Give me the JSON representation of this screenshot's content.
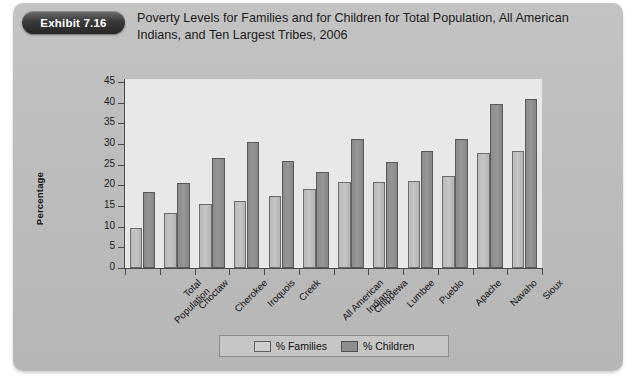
{
  "exhibit": {
    "badge_label": "Exhibit 7.16"
  },
  "header": {
    "title": "Poverty Levels for Families and for Children for Total Population, All American Indians, and Ten Largest Tribes, 2006"
  },
  "legend": {
    "families_label": "% Families",
    "children_label": "% Children"
  },
  "chart_data": {
    "type": "bar",
    "title": "Poverty Levels for Families and for Children for Total Population, All American Indians, and Ten Largest Tribes, 2006",
    "xlabel": "",
    "ylabel": "Percentage",
    "ylim": [
      0,
      45
    ],
    "ytick_step": 5,
    "yticks": [
      0,
      5,
      10,
      15,
      20,
      25,
      30,
      35,
      40,
      45
    ],
    "grid": false,
    "legend_position": "bottom-center",
    "categories": [
      "Total Population",
      "Choctaw",
      "Cherokee",
      "Iroquois",
      "Creek",
      "All American Indians",
      "Chippewa",
      "Lumbee",
      "Pueblo",
      "Apache",
      "Navaho",
      "Sioux"
    ],
    "category_lines": [
      [
        "Total",
        "Population"
      ],
      [
        "Choctaw"
      ],
      [
        "Cherokee"
      ],
      [
        "Iroquois"
      ],
      [
        "Creek"
      ],
      [
        "All American",
        "Indians"
      ],
      [
        "Chippewa"
      ],
      [
        "Lumbee"
      ],
      [
        "Pueblo"
      ],
      [
        "Apache"
      ],
      [
        "Navaho"
      ],
      [
        "Sioux"
      ]
    ],
    "series": [
      {
        "name": "% Families",
        "color": "#c0c0be",
        "values": [
          9.8,
          13.4,
          15.5,
          16.2,
          17.5,
          19.2,
          20.8,
          20.8,
          21.0,
          22.3,
          27.8,
          28.2
        ]
      },
      {
        "name": "% Children",
        "color": "#8f8f8f",
        "values": [
          18.3,
          20.5,
          26.5,
          30.6,
          25.8,
          23.3,
          31.1,
          25.6,
          28.2,
          31.1,
          39.8,
          41.0
        ]
      }
    ]
  },
  "colors": {
    "panel_background": "#bdbdbd",
    "plot_background": "#e8e8e6",
    "axis": "#4a4a4a",
    "families_bar": "#c0c0be",
    "children_bar": "#8f8f8f",
    "badge": "#2b2b2b"
  }
}
